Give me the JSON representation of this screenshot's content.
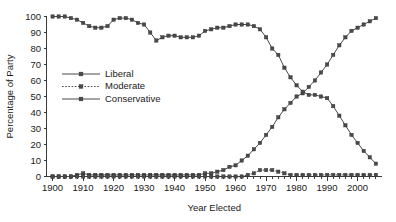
{
  "chart_data": {
    "type": "line",
    "title": "",
    "xlabel": "Year Elected",
    "ylabel": "Percentage of Party",
    "xlim": [
      1898,
      2008
    ],
    "ylim": [
      0,
      100
    ],
    "grid": false,
    "legend_position": "inside-left",
    "xticks": [
      1900,
      1910,
      1920,
      1930,
      1940,
      1950,
      1960,
      1970,
      1980,
      1990,
      2000
    ],
    "xtick_labels": [
      "1900",
      "1910",
      "1920",
      "1930",
      "1940",
      "1950",
      "1960",
      "1970",
      "1980",
      "1990",
      "2000"
    ],
    "yticks": [
      0,
      10,
      20,
      30,
      40,
      50,
      60,
      70,
      80,
      90,
      100
    ],
    "ytick_labels": [
      "0",
      "10",
      "20",
      "30",
      "40",
      "50",
      "60",
      "70",
      "80",
      "90",
      "100"
    ],
    "x": [
      1900,
      1902,
      1904,
      1906,
      1908,
      1910,
      1912,
      1914,
      1916,
      1918,
      1920,
      1922,
      1924,
      1926,
      1928,
      1930,
      1932,
      1934,
      1936,
      1938,
      1940,
      1942,
      1944,
      1946,
      1948,
      1950,
      1952,
      1954,
      1956,
      1958,
      1960,
      1962,
      1964,
      1966,
      1968,
      1970,
      1972,
      1974,
      1976,
      1978,
      1980,
      1982,
      1984,
      1986,
      1988,
      1990,
      1992,
      1994,
      1996,
      1998,
      2000,
      2002,
      2004,
      2006
    ],
    "series": [
      {
        "name": "Liberal",
        "linestyle": "solid",
        "marker": "square",
        "color": "#4a4a4a",
        "values": [
          0,
          0,
          0,
          0,
          1,
          2,
          1,
          1,
          1,
          1,
          1,
          1,
          1,
          1,
          1,
          1,
          1,
          1,
          1,
          1,
          1,
          1,
          1,
          1,
          1,
          2,
          2,
          3,
          4,
          6,
          7,
          10,
          13,
          17,
          21,
          26,
          31,
          37,
          42,
          46,
          50,
          52,
          56,
          60,
          65,
          70,
          76,
          82,
          87,
          91,
          93,
          95,
          97,
          99
        ]
      },
      {
        "name": "Moderate",
        "linestyle": "dotted",
        "marker": "square",
        "color": "#4a4a4a",
        "values": [
          0,
          0,
          0,
          0,
          0,
          0,
          0,
          0,
          0,
          0,
          0,
          0,
          0,
          0,
          0,
          0,
          0,
          0,
          0,
          0,
          0,
          0,
          0,
          0,
          0,
          0,
          0,
          0,
          0,
          0,
          0,
          0,
          1,
          2,
          4,
          4,
          4,
          3,
          2,
          1,
          1,
          1,
          1,
          1,
          1,
          1,
          1,
          1,
          1,
          1,
          1,
          1,
          1,
          1
        ]
      },
      {
        "name": "Conservative",
        "linestyle": "solid",
        "marker": "square",
        "color": "#4a4a4a",
        "values": [
          100,
          100,
          100,
          99,
          98,
          96,
          94,
          93,
          93,
          94,
          98,
          99,
          99,
          98,
          96,
          95,
          90,
          85,
          87,
          88,
          88,
          87,
          87,
          87,
          88,
          91,
          92,
          93,
          93,
          94,
          95,
          95,
          95,
          94,
          92,
          87,
          80,
          76,
          68,
          62,
          57,
          53,
          51,
          51,
          50,
          49,
          44,
          38,
          32,
          26,
          21,
          16,
          12,
          8
        ]
      }
    ],
    "annotations": []
  },
  "legend": {
    "entries": [
      {
        "label": "Liberal"
      },
      {
        "label": "Moderate"
      },
      {
        "label": "Conservative"
      }
    ]
  }
}
